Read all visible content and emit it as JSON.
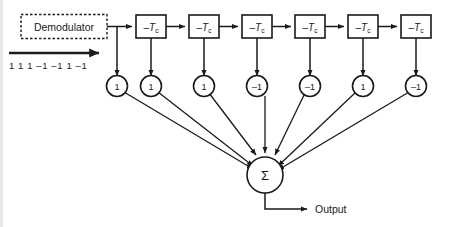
{
  "diagram": {
    "background_color": "#ffffff",
    "line_color": "#1a1a1a",
    "input": {
      "source_label": "Demodulator",
      "sequence_label": "1 1 1 –1 –1 1 –1",
      "arrow_icon": "right-arrow-icon"
    },
    "delay_blocks": [
      {
        "sign": "–",
        "symbol": "T",
        "subscript": "c"
      },
      {
        "sign": "–",
        "symbol": "T",
        "subscript": "c"
      },
      {
        "sign": "–",
        "symbol": "T",
        "subscript": "c"
      },
      {
        "sign": "–",
        "symbol": "T",
        "subscript": "c"
      },
      {
        "sign": "–",
        "symbol": "T",
        "subscript": "c"
      },
      {
        "sign": "–",
        "symbol": "T",
        "subscript": "c"
      }
    ],
    "taps": [
      {
        "value": "1"
      },
      {
        "value": "1"
      },
      {
        "value": "1"
      },
      {
        "value": "–1"
      },
      {
        "value": "–1"
      },
      {
        "value": "1"
      },
      {
        "value": "–1"
      }
    ],
    "summer": {
      "label": "Σ"
    },
    "output": {
      "label": "Output"
    }
  }
}
